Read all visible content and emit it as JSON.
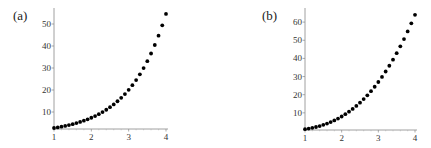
{
  "chart_data": [
    {
      "type": "scatter",
      "panel_label": "(a)",
      "title": "",
      "xlabel": "",
      "ylabel": "",
      "function": "e^x",
      "x": [
        1.0,
        1.1,
        1.2,
        1.3,
        1.4,
        1.5,
        1.6,
        1.7,
        1.8,
        1.9,
        2.0,
        2.1,
        2.2,
        2.3,
        2.4,
        2.5,
        2.6,
        2.7,
        2.8,
        2.9,
        3.0,
        3.1,
        3.2,
        3.3,
        3.4,
        3.5,
        3.6,
        3.7,
        3.8,
        3.9,
        4.0
      ],
      "y": [
        2.72,
        3.0,
        3.32,
        3.67,
        4.06,
        4.48,
        4.95,
        5.47,
        6.05,
        6.69,
        7.39,
        8.17,
        9.03,
        9.97,
        11.02,
        12.18,
        13.46,
        14.88,
        16.44,
        18.17,
        20.09,
        22.2,
        24.53,
        27.11,
        29.96,
        33.12,
        36.6,
        40.45,
        44.7,
        49.4,
        54.6
      ],
      "xticks": [
        "1",
        "2",
        "3",
        "4"
      ],
      "yticks": [
        "10",
        "20",
        "30",
        "40",
        "50"
      ],
      "xlim": [
        1,
        4
      ],
      "ylim": [
        0,
        55
      ],
      "grid": false,
      "legend": null
    },
    {
      "type": "scatter",
      "panel_label": "(b)",
      "title": "",
      "xlabel": "",
      "ylabel": "",
      "function": "x^3",
      "x": [
        1.0,
        1.1,
        1.2,
        1.3,
        1.4,
        1.5,
        1.6,
        1.7,
        1.8,
        1.9,
        2.0,
        2.1,
        2.2,
        2.3,
        2.4,
        2.5,
        2.6,
        2.7,
        2.8,
        2.9,
        3.0,
        3.1,
        3.2,
        3.3,
        3.4,
        3.5,
        3.6,
        3.7,
        3.8,
        3.9,
        4.0
      ],
      "y": [
        1.0,
        1.33,
        1.73,
        2.2,
        2.74,
        3.38,
        4.1,
        4.91,
        5.83,
        6.86,
        8.0,
        9.26,
        10.65,
        12.17,
        13.82,
        15.63,
        17.58,
        19.68,
        21.95,
        24.39,
        27.0,
        29.79,
        32.77,
        35.94,
        39.3,
        42.88,
        46.66,
        50.65,
        54.87,
        59.32,
        64.0
      ],
      "xticks": [
        "1",
        "2",
        "3",
        "4"
      ],
      "yticks": [
        "10",
        "20",
        "30",
        "40",
        "50",
        "60"
      ],
      "xlim": [
        1,
        4
      ],
      "ylim": [
        0,
        65
      ],
      "grid": false,
      "legend": null
    }
  ],
  "panels": {
    "a": {
      "label": "(a)",
      "geom": {
        "x0px": 54,
        "x1px": 166,
        "axisYpx": 129,
        "y0px": 134,
        "pxPerY": 2.2,
        "topPx": 8
      },
      "xticks": [
        {
          "v": 1,
          "t": "1"
        },
        {
          "v": 2,
          "t": "2"
        },
        {
          "v": 3,
          "t": "3"
        },
        {
          "v": 4,
          "t": "4"
        }
      ],
      "yticks": [
        {
          "v": 10,
          "t": "10"
        },
        {
          "v": 20,
          "t": "20"
        },
        {
          "v": 30,
          "t": "30"
        },
        {
          "v": 40,
          "t": "40"
        },
        {
          "v": 50,
          "t": "50"
        }
      ]
    },
    "b": {
      "label": "(b)",
      "geom": {
        "x0px": 305,
        "x1px": 415,
        "axisYpx": 130,
        "y0px": 131,
        "pxPerY": 1.815,
        "topPx": 8
      },
      "xticks": [
        {
          "v": 1,
          "t": "1"
        },
        {
          "v": 2,
          "t": "2"
        },
        {
          "v": 3,
          "t": "3"
        },
        {
          "v": 4,
          "t": "4"
        }
      ],
      "yticks": [
        {
          "v": 10,
          "t": "10"
        },
        {
          "v": 20,
          "t": "20"
        },
        {
          "v": 30,
          "t": "30"
        },
        {
          "v": 40,
          "t": "40"
        },
        {
          "v": 50,
          "t": "50"
        },
        {
          "v": 60,
          "t": "60"
        }
      ]
    }
  }
}
